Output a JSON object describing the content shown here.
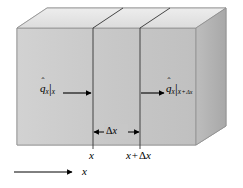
{
  "figure": {
    "background_color": "#ffffff",
    "width": 243,
    "height": 188
  },
  "block": {
    "name": "rectangular-slab",
    "front_face_color": "#c9c9c9",
    "top_face_color": "#e2e2e2",
    "right_face_color": "#b0b0b0",
    "outline_color": "#8a8a8a"
  },
  "labels": {
    "flux_in": {
      "symbol": "q",
      "accent": "hat",
      "subscript": "x",
      "evaluated_at": "x",
      "text": "q̂x|x"
    },
    "flux_out": {
      "symbol": "q",
      "accent": "hat",
      "subscript": "x",
      "evaluated_at": "x + Δx",
      "text": "q̂x|x+Δx"
    },
    "thickness": {
      "text": "Δx",
      "delta": "Δ",
      "variable": "x"
    },
    "tick_left": {
      "text": "x"
    },
    "tick_right": {
      "text": "x + Δx",
      "variable": "x",
      "operator": "+",
      "delta": "Δ",
      "delta_variable": "x"
    },
    "axis": {
      "text": "x"
    }
  },
  "arrows": {
    "flux_in_direction": "right",
    "flux_out_direction": "right",
    "dimension_arrow_style": "double-headed",
    "axis_arrow_direction": "right",
    "color": "#000000"
  }
}
